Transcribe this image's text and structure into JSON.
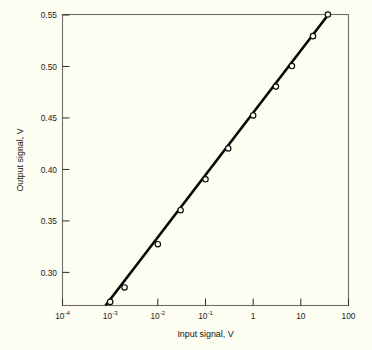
{
  "chart_data": {
    "type": "line",
    "title": "",
    "xlabel": "Input signal, V",
    "ylabel": "Output signal, V",
    "xscale": "log",
    "yscale": "linear",
    "xlim": [
      0.0001,
      100
    ],
    "ylim": [
      0.2675,
      0.55
    ],
    "grid": false,
    "legend": null,
    "xticks": [
      0.0001,
      0.001,
      0.01,
      0.1,
      1,
      10,
      100
    ],
    "xticklabels": [
      "10⁻⁴",
      "10⁻³",
      "10⁻²",
      "10⁻¹",
      "1",
      "10",
      "100"
    ],
    "xtick_mantissa": [
      "10",
      "10",
      "10",
      "10",
      "1",
      "10",
      "100"
    ],
    "xtick_exponent": [
      "-4",
      "-3",
      "-2",
      "-1",
      "",
      "",
      ""
    ],
    "yticks": [
      0.3,
      0.35,
      0.4,
      0.45,
      0.5,
      0.55
    ],
    "yticklabels": [
      "0.30",
      "0.35",
      "0.40",
      "0.45",
      "0.50",
      "0.55"
    ],
    "series": [
      {
        "name": "Output signal",
        "marker": "open-circle",
        "line": "solid",
        "color": "#060606",
        "x": [
          0.001,
          0.002,
          0.01,
          0.03,
          0.1,
          0.3,
          1.0,
          3.0,
          6.5,
          18.0,
          37.0
        ],
        "y": [
          0.271,
          0.285,
          0.327,
          0.36,
          0.39,
          0.42,
          0.452,
          0.48,
          0.5,
          0.529,
          0.55
        ]
      }
    ],
    "line_endpoints": {
      "x": [
        0.0008,
        40.0
      ],
      "y": [
        0.2675,
        0.5515
      ]
    }
  },
  "figure": {
    "background_color": "#fdfdf2",
    "axis_color": "#6e6e66",
    "text_color": "#141414"
  }
}
